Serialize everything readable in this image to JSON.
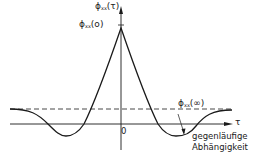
{
  "diagram": {
    "type": "autocorrelation-function-sketch",
    "y_axis_label": {
      "symbol": "ϕ",
      "subscript": "xx",
      "arg": "(τ)"
    },
    "peak_label": {
      "symbol": "ϕ",
      "subscript": "xx",
      "arg": "(o)"
    },
    "asymptote_label": {
      "symbol": "ϕ",
      "subscript": "xx",
      "arg": "(∞)"
    },
    "x_axis_label": "τ",
    "origin_label": "0",
    "annotation_line1": "gegenläufige",
    "annotation_line2": "Abhängigkeit",
    "colors": {
      "line": "#1a1a1a",
      "background": "#ffffff"
    }
  }
}
